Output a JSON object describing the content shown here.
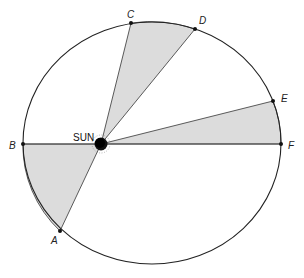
{
  "diagram": {
    "colors": {
      "orbit_stroke": "#222222",
      "sector_fill": "#dcdcdc",
      "sector_stroke": "#333333",
      "sun_fill": "#111111",
      "background": "#ffffff"
    },
    "orbit": {
      "cx": 152,
      "cy": 143,
      "rx": 129,
      "ry": 121
    },
    "sun": {
      "label": "SUN",
      "x": 101,
      "y": 144
    },
    "points": [
      {
        "id": "A",
        "label": "A",
        "x": 60,
        "y": 231
      },
      {
        "id": "B",
        "label": "B",
        "x": 23,
        "y": 144
      },
      {
        "id": "C",
        "label": "C",
        "x": 131,
        "y": 23
      },
      {
        "id": "D",
        "label": "D",
        "x": 195,
        "y": 29
      },
      {
        "id": "E",
        "label": "E",
        "x": 273,
        "y": 101
      },
      {
        "id": "F",
        "label": "F",
        "x": 281,
        "y": 144
      }
    ],
    "sectors": [
      {
        "name": "sector-A-B",
        "from": "A",
        "to": "B"
      },
      {
        "name": "sector-C-D",
        "from": "C",
        "to": "D"
      },
      {
        "name": "sector-E-F",
        "from": "E",
        "to": "F"
      }
    ]
  }
}
